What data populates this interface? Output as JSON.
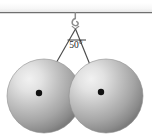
{
  "figure": {
    "name": "two-spheres-hanging-from-hook-diagram",
    "background_color": "#ffffff",
    "width": 152,
    "height": 139
  },
  "ceiling": {
    "label": "ceiling",
    "line_color": "#6b6b6b",
    "band_color": "#f2f2f2",
    "y": 12.5,
    "x_start": 0,
    "x_end": 152
  },
  "hook": {
    "label": "hook",
    "color": "#8a8a8a",
    "attach_x": 75,
    "attach_y": 12.5,
    "shank_bottom_y": 21
  },
  "apex": {
    "x": 75.5,
    "y": 29
  },
  "angle": {
    "value": "50°",
    "degrees": 50,
    "label_x": 75.5,
    "label_y": 47,
    "arc_color": "#3a3a3a",
    "tick_y": 40,
    "tick_x_start": 68,
    "tick_x_end": 86
  },
  "cords": [
    {
      "name": "left-cord",
      "color": "#4a4a4a",
      "x1": 75.5,
      "y1": 29,
      "x2": 39,
      "y2": 93
    },
    {
      "name": "right-cord",
      "color": "#4a4a4a",
      "x1": 75.5,
      "y1": 29,
      "x2": 101,
      "y2": 92
    }
  ],
  "spheres": [
    {
      "name": "left-sphere",
      "cx": 44,
      "cy": 96,
      "r": 37,
      "highlight_color": "#ededed",
      "mid_color": "#b9b9b9",
      "edge_color": "#7e7e7e",
      "center_dot_x": 39,
      "center_dot_y": 93,
      "center_dot_r": 3.2,
      "center_dot_color": "#111111"
    },
    {
      "name": "right-sphere",
      "cx": 106,
      "cy": 96,
      "r": 37,
      "highlight_color": "#ededed",
      "mid_color": "#b9b9b9",
      "edge_color": "#7e7e7e",
      "center_dot_x": 101,
      "center_dot_y": 92,
      "center_dot_r": 3.2,
      "center_dot_color": "#111111"
    }
  ]
}
